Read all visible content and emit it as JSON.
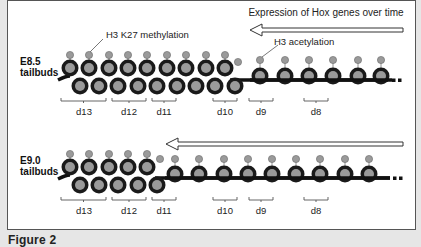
{
  "caption": "Figure 2",
  "arrow_label": "Expression of Hox genes over time",
  "annotations": {
    "methylation": "H3 K27 methylation",
    "acetylation": "H3 acetylation"
  },
  "rows": [
    {
      "stage_line1": "E8.5",
      "stage_line2": "tailbuds",
      "segments": [
        "d13",
        "d12",
        "d11",
        "d10",
        "d9",
        "d8"
      ]
    },
    {
      "stage_line1": "E9.0",
      "stage_line2": "tailbuds",
      "segments": [
        "d13",
        "d12",
        "d11",
        "d10",
        "d9",
        "d8"
      ]
    }
  ],
  "colors": {
    "bead_ring": "#1a1a1a",
    "bead_core": "#9a9a9a",
    "dna_line": "#111111",
    "frame": "#555555"
  }
}
